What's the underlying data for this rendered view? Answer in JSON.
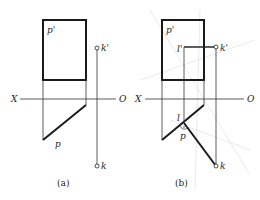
{
  "colors": {
    "ink": "#1a1a1a",
    "thin": "#333333",
    "faint": "#d8d8d8"
  },
  "panels": [
    {
      "caption": "(a)",
      "labels": {
        "p_prime": "p'",
        "p": "p",
        "k_prime": "k'",
        "k": "k",
        "x_axis_left": "X",
        "x_axis_right": "O"
      }
    },
    {
      "caption": "(b)",
      "labels": {
        "p_prime": "p'",
        "p": "p",
        "k_prime": "k'",
        "k": "k",
        "l_prime": "l'",
        "l": "l",
        "x_axis_left": "X",
        "x_axis_right": "O"
      }
    }
  ]
}
